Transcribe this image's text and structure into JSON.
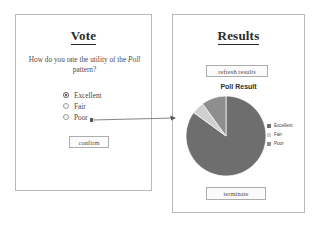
{
  "vote_panel": {
    "title": "Vote",
    "question_prefix": "How do you rate the utility of the ",
    "question_emph": "Poll",
    "question_suffix": " pattern?",
    "options": [
      {
        "label": "Excellent",
        "selected": true
      },
      {
        "label": "Fair",
        "selected": false
      },
      {
        "label": "Poor",
        "selected": false
      }
    ],
    "confirm_label": "confirm"
  },
  "results_panel": {
    "title": "Results",
    "refresh_label": "refresh results",
    "terminate_label": "terminate"
  },
  "connector": {
    "from": "confirm-button",
    "to": "results-panel",
    "direction": "right"
  },
  "colors": {
    "excellent": "#6e6e6e",
    "fair": "#d0d0d0",
    "poor": "#8e8e8e",
    "panel_border": "#b9b9b9",
    "text": "#3a3a3a"
  },
  "chart_data": {
    "type": "pie",
    "title": "Poll Result",
    "categories": [
      "Excellent",
      "Fair",
      "Poor"
    ],
    "values": [
      85,
      5,
      10
    ],
    "colors": [
      "#6e6e6e",
      "#d0d0d0",
      "#8e8e8e"
    ],
    "legend_position": "right",
    "labels_shown": false,
    "start_angle": -90,
    "legend": [
      {
        "label": "Excellent",
        "color": "#6e6e6e"
      },
      {
        "label": "Fair",
        "color": "#d0d0d0"
      },
      {
        "label": "Poor",
        "color": "#8e8e8e"
      }
    ]
  }
}
